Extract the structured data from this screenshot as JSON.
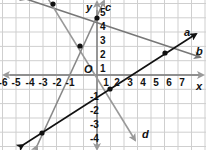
{
  "diagram": {
    "type": "coordinate-plane",
    "x_axis": {
      "label": "x",
      "ticks": [
        "-6",
        "-5",
        "-4",
        "-3",
        "-2",
        "-1",
        "1",
        "2",
        "3",
        "4",
        "5",
        "6",
        "7"
      ]
    },
    "y_axis": {
      "label": "y",
      "ticks": [
        "5",
        "4",
        "3",
        "2",
        "1",
        "-1",
        "-2",
        "-3",
        "-4"
      ]
    },
    "origin_label": "O",
    "lines": [
      {
        "name": "a",
        "color": "#111111",
        "through": [
          [
            -4,
            -4
          ],
          [
            1,
            -1
          ],
          [
            6,
            2
          ]
        ]
      },
      {
        "name": "b",
        "color": "#777777",
        "through": [
          [
            -3,
            5
          ],
          [
            0,
            4
          ],
          [
            6,
            2
          ]
        ]
      },
      {
        "name": "c",
        "color": "#777777",
        "through": [
          [
            -4,
            -4
          ],
          [
            -1,
            2
          ],
          [
            0,
            4
          ]
        ]
      },
      {
        "name": "d",
        "color": "#888888",
        "through": [
          [
            -3,
            5
          ],
          [
            -1,
            2
          ],
          [
            1,
            -1
          ]
        ]
      }
    ],
    "points": [
      [
        -3,
        5
      ],
      [
        0,
        4
      ],
      [
        -1,
        2
      ],
      [
        1,
        -1
      ],
      [
        6,
        2
      ],
      [
        -4,
        -4
      ]
    ]
  },
  "labels": {
    "x": "x",
    "y": "y",
    "o": "O",
    "a": "a",
    "b": "b",
    "c": "c",
    "d": "d"
  },
  "ticks": {
    "xn6": "-6",
    "xn5": "-5",
    "xn4": "-4",
    "xn3": "-3",
    "xn2": "-2",
    "xn1": "-1",
    "x1": "1",
    "x2": "2",
    "x3": "3",
    "x4": "4",
    "x5": "5",
    "x6": "6",
    "x7": "7",
    "y5": "5",
    "y4": "4",
    "y3": "3",
    "y2": "2",
    "y1": "1",
    "yn1": "-1",
    "yn2": "-2",
    "yn3": "-3",
    "yn4": "-4"
  }
}
